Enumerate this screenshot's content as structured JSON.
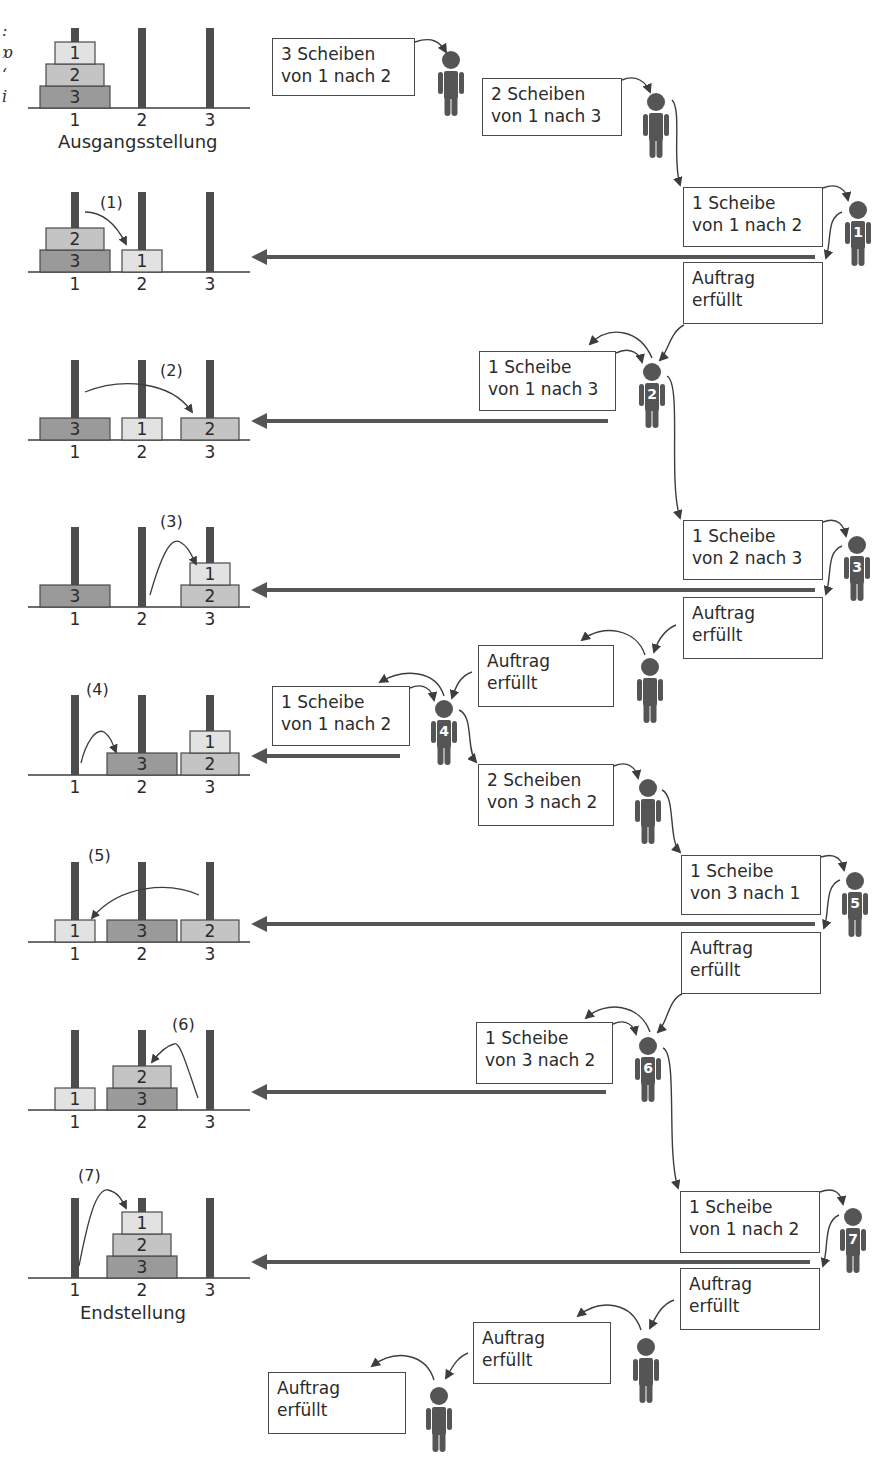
{
  "colors": {
    "peg": "#4d4d4d",
    "disc1": "#e2e2e2",
    "disc2": "#c4c4c4",
    "disc3": "#9a9a9a",
    "border": "#4a4a4a",
    "agent": "#555555",
    "arrow": "#555555"
  },
  "margin_glyphs": [
    ":",
    "ɒ",
    "ʻ",
    "i"
  ],
  "captions": {
    "start": "Ausgangsstellung",
    "end": "Endstellung"
  },
  "peg_labels": [
    "1",
    "2",
    "3"
  ],
  "boards": [
    {
      "id": "start",
      "step": "",
      "y": 108,
      "pegs": [
        [
          3,
          2,
          1
        ],
        [],
        []
      ]
    },
    {
      "id": "s1",
      "step": "(1)",
      "y": 272,
      "pegs": [
        [
          3,
          2
        ],
        [
          1
        ],
        []
      ]
    },
    {
      "id": "s2",
      "step": "(2)",
      "y": 440,
      "pegs": [
        [
          3
        ],
        [
          1
        ],
        [
          2
        ]
      ]
    },
    {
      "id": "s3",
      "step": "(3)",
      "y": 607,
      "pegs": [
        [
          3
        ],
        [],
        [
          2,
          1
        ]
      ]
    },
    {
      "id": "s4",
      "step": "(4)",
      "y": 775,
      "pegs": [
        [],
        [
          3
        ],
        [
          2,
          1
        ]
      ]
    },
    {
      "id": "s5",
      "step": "(5)",
      "y": 942,
      "pegs": [
        [
          1
        ],
        [
          3
        ],
        [
          2
        ]
      ]
    },
    {
      "id": "s6",
      "step": "(6)",
      "y": 1110,
      "pegs": [
        [
          1
        ],
        [
          3,
          2
        ],
        []
      ]
    },
    {
      "id": "s7",
      "step": "(7)",
      "y": 1278,
      "pegs": [
        [],
        [
          3,
          2,
          1
        ],
        []
      ]
    }
  ],
  "messages": [
    {
      "id": "m1",
      "x": 272,
      "y": 38,
      "w": 143,
      "h": 58,
      "lines": [
        "3 Scheiben",
        "von 1 nach 2"
      ]
    },
    {
      "id": "m2",
      "x": 482,
      "y": 78,
      "w": 140,
      "h": 58,
      "lines": [
        "2 Scheiben",
        "von 1 nach 3"
      ]
    },
    {
      "id": "m3",
      "x": 683,
      "y": 187,
      "w": 140,
      "h": 60,
      "lines": [
        "1 Scheibe",
        "von 1 nach 2"
      ]
    },
    {
      "id": "m4",
      "x": 683,
      "y": 262,
      "w": 140,
      "h": 62,
      "lines": [
        "Auftrag",
        "erfüllt"
      ]
    },
    {
      "id": "m5",
      "x": 479,
      "y": 351,
      "w": 137,
      "h": 60,
      "lines": [
        "1 Scheibe",
        "von 1 nach 3"
      ]
    },
    {
      "id": "m6",
      "x": 683,
      "y": 520,
      "w": 140,
      "h": 60,
      "lines": [
        "1 Scheibe",
        "von 2 nach 3"
      ]
    },
    {
      "id": "m7",
      "x": 683,
      "y": 597,
      "w": 140,
      "h": 62,
      "lines": [
        "Auftrag",
        "erfüllt"
      ]
    },
    {
      "id": "m8",
      "x": 478,
      "y": 645,
      "w": 136,
      "h": 62,
      "lines": [
        "Auftrag",
        "erfüllt"
      ]
    },
    {
      "id": "m9",
      "x": 272,
      "y": 686,
      "w": 138,
      "h": 60,
      "lines": [
        "1 Scheibe",
        "von 1 nach 2"
      ]
    },
    {
      "id": "m10",
      "x": 478,
      "y": 764,
      "w": 136,
      "h": 62,
      "lines": [
        "2 Scheiben",
        "von 3 nach 2"
      ]
    },
    {
      "id": "m11",
      "x": 681,
      "y": 855,
      "w": 140,
      "h": 60,
      "lines": [
        "1 Scheibe",
        "von 3 nach 1"
      ]
    },
    {
      "id": "m12",
      "x": 681,
      "y": 932,
      "w": 140,
      "h": 62,
      "lines": [
        "Auftrag",
        "erfüllt"
      ]
    },
    {
      "id": "m13",
      "x": 476,
      "y": 1022,
      "w": 137,
      "h": 62,
      "lines": [
        "1 Scheibe",
        "von 3 nach 2"
      ]
    },
    {
      "id": "m14",
      "x": 680,
      "y": 1191,
      "w": 140,
      "h": 62,
      "lines": [
        "1 Scheibe",
        "von 1 nach 2"
      ]
    },
    {
      "id": "m15",
      "x": 680,
      "y": 1268,
      "w": 140,
      "h": 62,
      "lines": [
        "Auftrag",
        "erfüllt"
      ]
    },
    {
      "id": "m16",
      "x": 473,
      "y": 1322,
      "w": 138,
      "h": 62,
      "lines": [
        "Auftrag",
        "erfüllt"
      ]
    },
    {
      "id": "m17",
      "x": 268,
      "y": 1372,
      "w": 138,
      "h": 62,
      "lines": [
        "Auftrag",
        "erfüllt"
      ]
    }
  ],
  "agents": [
    {
      "id": "a0",
      "x": 451,
      "y": 50,
      "num": ""
    },
    {
      "id": "a1",
      "x": 656,
      "y": 92,
      "num": ""
    },
    {
      "id": "a2",
      "x": 858,
      "y": 200,
      "num": "1"
    },
    {
      "id": "a3",
      "x": 652,
      "y": 362,
      "num": "2"
    },
    {
      "id": "a4",
      "x": 857,
      "y": 535,
      "num": "3"
    },
    {
      "id": "a5",
      "x": 650,
      "y": 657,
      "num": ""
    },
    {
      "id": "a6",
      "x": 444,
      "y": 699,
      "num": "4"
    },
    {
      "id": "a7",
      "x": 648,
      "y": 778,
      "num": ""
    },
    {
      "id": "a8",
      "x": 855,
      "y": 871,
      "num": "5"
    },
    {
      "id": "a9",
      "x": 648,
      "y": 1036,
      "num": "6"
    },
    {
      "id": "a10",
      "x": 853,
      "y": 1207,
      "num": "7"
    },
    {
      "id": "a11",
      "x": 646,
      "y": 1337,
      "num": ""
    },
    {
      "id": "a12",
      "x": 439,
      "y": 1386,
      "num": ""
    }
  ],
  "return_arrows": [
    {
      "y": 257,
      "x1": 250,
      "x2": 815
    },
    {
      "y": 421,
      "x1": 250,
      "x2": 608
    },
    {
      "y": 590,
      "x1": 250,
      "x2": 815
    },
    {
      "y": 756,
      "x1": 250,
      "x2": 400
    },
    {
      "y": 924,
      "x1": 250,
      "x2": 815
    },
    {
      "y": 1092,
      "x1": 250,
      "x2": 606
    },
    {
      "y": 1262,
      "x1": 250,
      "x2": 810
    }
  ]
}
